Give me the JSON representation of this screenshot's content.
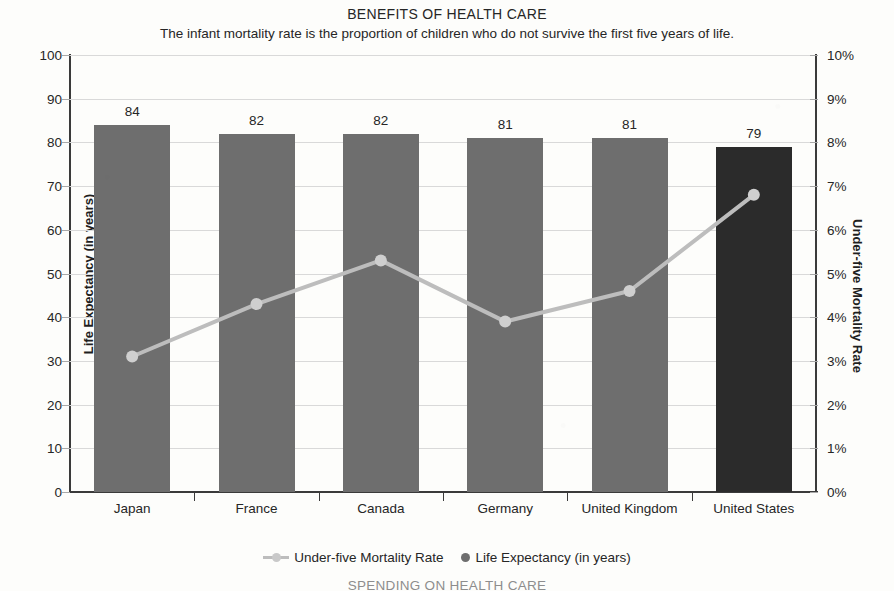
{
  "chart_data": {
    "type": "bar",
    "title": "BENEFITS OF HEALTH CARE",
    "subtitle": "The infant mortality rate is the proportion of children who do not survive the first five years of life.",
    "categories": [
      "Japan",
      "France",
      "Canada",
      "Germany",
      "United Kingdom",
      "United States"
    ],
    "xlabel": "",
    "ylabel": "Life Expectancy (in years)",
    "ylabel_right": "Under-five Mortality Rate",
    "ylim": [
      0,
      100
    ],
    "ylim_right": [
      0,
      10
    ],
    "ytick_labels": [
      "0",
      "10",
      "20",
      "30",
      "40",
      "50",
      "60",
      "70",
      "80",
      "90",
      "100"
    ],
    "ytick_values": [
      0,
      10,
      20,
      30,
      40,
      50,
      60,
      70,
      80,
      90,
      100
    ],
    "ytick_labels_right": [
      "0%",
      "1%",
      "2%",
      "3%",
      "4%",
      "5%",
      "6%",
      "7%",
      "8%",
      "9%",
      "10%"
    ],
    "ytick_values_right": [
      0,
      1,
      2,
      3,
      4,
      5,
      6,
      7,
      8,
      9,
      10
    ],
    "grid": true,
    "legend_position": "bottom",
    "series": [
      {
        "name": "Life Expectancy (in years)",
        "type": "bar",
        "axis": "left",
        "values": [
          84,
          82,
          82,
          81,
          81,
          79
        ],
        "data_labels": [
          "84",
          "82",
          "82",
          "81",
          "81",
          "79"
        ],
        "color": "#6e6e6e",
        "highlight_index": 5,
        "highlight_color": "#2b2b2b"
      },
      {
        "name": "Under-five Mortality Rate",
        "type": "line",
        "axis": "right",
        "values": [
          3.1,
          4.3,
          5.3,
          3.9,
          4.6,
          6.8
        ],
        "color": "#bdbdbd",
        "marker_color": "#cfcfcf"
      }
    ]
  },
  "bottom_cutoff_title": "SPENDING ON HEALTH CARE",
  "legend": [
    {
      "label": "Under-five Mortality Rate",
      "marker": "line-marker"
    },
    {
      "label": "Life Expectancy (in years)",
      "marker": "dot"
    }
  ]
}
